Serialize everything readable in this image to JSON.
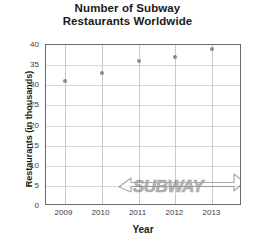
{
  "chart_data": {
    "type": "scatter",
    "title": "Number of Subway Restaurants Worldwide",
    "title_lines": [
      "Number of Subway",
      "Restaurants Worldwide"
    ],
    "xlabel": "Year",
    "ylabel": "Restaurants (in thousands)",
    "categories": [
      "2009",
      "2010",
      "2011",
      "2012",
      "2013"
    ],
    "x": [
      2009,
      2010,
      2011,
      2012,
      2013
    ],
    "values": [
      31,
      33,
      36,
      37,
      39
    ],
    "xlim": [
      2008.5,
      2013.8
    ],
    "ylim": [
      0,
      40
    ],
    "ytick_labels": [
      "0",
      "5",
      "10",
      "15",
      "20",
      "25",
      "30",
      "35",
      "40"
    ],
    "ytick_values": [
      0,
      5,
      10,
      15,
      20,
      25,
      30,
      35,
      40
    ],
    "xtick_labels": [
      "2009",
      "2010",
      "2011",
      "2012",
      "2013"
    ],
    "grid": true,
    "legend": false,
    "point_color": "#8a8a8a",
    "gridline_color": "#d9d9d9",
    "frame_color": "#6b6b6b",
    "text_color": "#1a1a1a",
    "watermark_text": "SUBWAY"
  }
}
